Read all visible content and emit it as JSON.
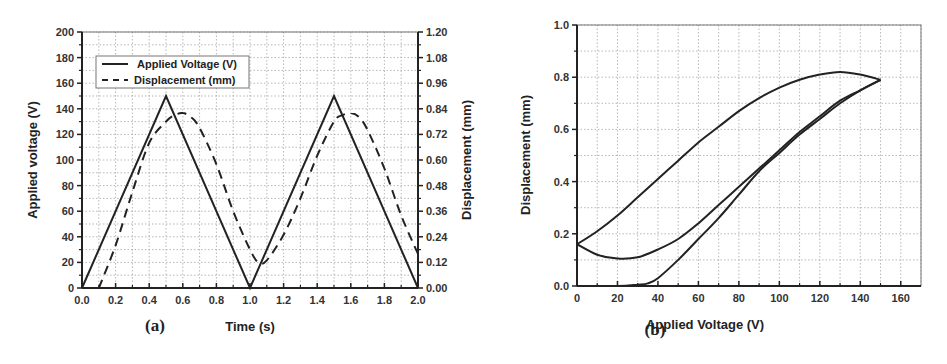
{
  "chart_data": [
    {
      "id": "a",
      "panel_label": "(a)",
      "type": "line",
      "title": "",
      "xlabel": "Time (s)",
      "ylabel": "Applied voltage (V)",
      "y2label": "Displacement (mm)",
      "xlim": [
        0,
        2.0
      ],
      "ylim": [
        0,
        200
      ],
      "y2lim": [
        0,
        1.2
      ],
      "xticks": [
        "0.0",
        "0.2",
        "0.4",
        "0.6",
        "0.8",
        "1.0",
        "1.2",
        "1.4",
        "1.6",
        "1.8",
        "2.0"
      ],
      "yticks": [
        "0",
        "20",
        "40",
        "60",
        "80",
        "100",
        "120",
        "140",
        "160",
        "180",
        "200"
      ],
      "y2ticks": [
        "0.00",
        "0.12",
        "0.24",
        "0.36",
        "0.48",
        "0.60",
        "0.72",
        "0.84",
        "0.96",
        "1.08",
        "1.20"
      ],
      "grid": true,
      "legend_position": "upper left",
      "legend": [
        "Applied Voltage (V)",
        "Displacement (mm)"
      ],
      "series": [
        {
          "name": "Applied Voltage (V)",
          "axis": "left",
          "style": "solid",
          "x": [
            0,
            0.5,
            1.0,
            1.5,
            2.0
          ],
          "values": [
            0,
            150,
            0,
            150,
            0
          ]
        },
        {
          "name": "Displacement (mm)",
          "axis": "right",
          "style": "dashed",
          "x": [
            0.1,
            0.2,
            0.3,
            0.4,
            0.5,
            0.55,
            0.6,
            0.65,
            0.7,
            0.8,
            0.9,
            1.0,
            1.05,
            1.1,
            1.2,
            1.3,
            1.4,
            1.5,
            1.55,
            1.6,
            1.65,
            1.7,
            1.8,
            1.9,
            2.0
          ],
          "values": [
            0.0,
            0.2,
            0.45,
            0.68,
            0.78,
            0.81,
            0.82,
            0.8,
            0.75,
            0.58,
            0.36,
            0.18,
            0.12,
            0.13,
            0.25,
            0.42,
            0.62,
            0.78,
            0.81,
            0.82,
            0.8,
            0.74,
            0.56,
            0.34,
            0.16
          ]
        }
      ]
    },
    {
      "id": "b",
      "panel_label": "(b)",
      "type": "line",
      "title": "",
      "xlabel": "Applied Voltage (V)",
      "ylabel": "Displacement (mm)",
      "xlim": [
        0,
        170
      ],
      "ylim": [
        0,
        1.0
      ],
      "xticks": [
        "0",
        "20",
        "40",
        "60",
        "80",
        "100",
        "120",
        "140",
        "160"
      ],
      "yticks": [
        "0.0",
        "0.2",
        "0.4",
        "0.6",
        "0.8",
        "1.0"
      ],
      "grid": true,
      "series": [
        {
          "name": "Initial loading",
          "x": [
            0,
            20,
            30,
            35,
            40,
            50,
            60,
            70,
            80,
            90,
            100,
            110,
            120,
            130,
            140,
            150
          ],
          "values": [
            0.0,
            0.0,
            0.005,
            0.01,
            0.03,
            0.1,
            0.18,
            0.26,
            0.35,
            0.44,
            0.51,
            0.58,
            0.64,
            0.7,
            0.75,
            0.79
          ]
        },
        {
          "name": "Unloading",
          "x": [
            150,
            140,
            130,
            120,
            110,
            100,
            90,
            80,
            70,
            60,
            50,
            40,
            30,
            20,
            10,
            0
          ],
          "values": [
            0.79,
            0.81,
            0.82,
            0.81,
            0.79,
            0.76,
            0.72,
            0.67,
            0.61,
            0.55,
            0.48,
            0.41,
            0.34,
            0.27,
            0.21,
            0.16
          ]
        },
        {
          "name": "Reloading",
          "x": [
            0,
            10,
            20,
            30,
            40,
            50,
            60,
            70,
            80,
            90,
            100,
            110,
            120,
            130,
            140,
            150
          ],
          "values": [
            0.16,
            0.12,
            0.105,
            0.11,
            0.14,
            0.18,
            0.24,
            0.31,
            0.38,
            0.45,
            0.52,
            0.59,
            0.65,
            0.71,
            0.75,
            0.79
          ]
        }
      ]
    }
  ]
}
